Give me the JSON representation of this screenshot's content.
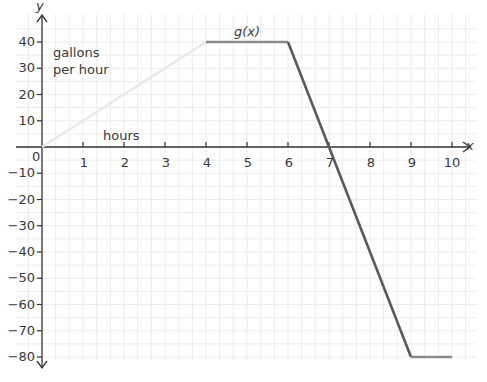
{
  "chart_data": {
    "type": "line",
    "title": "",
    "function_label": "g(x)",
    "xlabel": "hours",
    "ylabel": "gallons per hour",
    "ylabel_lines": [
      "gallons",
      "per hour"
    ],
    "x_axis_name": "x",
    "y_axis_name": "y",
    "xlim": [
      0,
      10
    ],
    "ylim": [
      -80,
      40
    ],
    "grid": true,
    "x_ticks": [
      1,
      2,
      3,
      4,
      5,
      6,
      7,
      8,
      9,
      10
    ],
    "y_ticks": [
      40,
      30,
      20,
      10,
      -10,
      -20,
      -30,
      -40,
      -50,
      -60,
      -70,
      -80
    ],
    "origin_label": "0",
    "series": [
      {
        "name": "g(x)",
        "segments": [
          {
            "x": [
              0,
              4
            ],
            "y": [
              0,
              40
            ],
            "color": "#e8e8e8"
          },
          {
            "x": [
              4,
              6
            ],
            "y": [
              40,
              40
            ],
            "color": "#8a8a8a"
          },
          {
            "x": [
              6,
              9
            ],
            "y": [
              40,
              -80
            ],
            "color": "#5a5a5a"
          },
          {
            "x": [
              9,
              10
            ],
            "y": [
              -80,
              -80
            ],
            "color": "#8a8a8a"
          }
        ]
      }
    ],
    "points": [
      [
        0,
        0
      ],
      [
        4,
        40
      ],
      [
        6,
        40
      ],
      [
        7,
        0
      ],
      [
        9,
        -80
      ],
      [
        10,
        -80
      ]
    ]
  },
  "labels": {
    "function": "g(x)",
    "x_axis": "x",
    "y_axis": "y",
    "origin": "0",
    "xlabel": "hours",
    "ylabel_line1": "gallons",
    "ylabel_line2": "per hour"
  }
}
